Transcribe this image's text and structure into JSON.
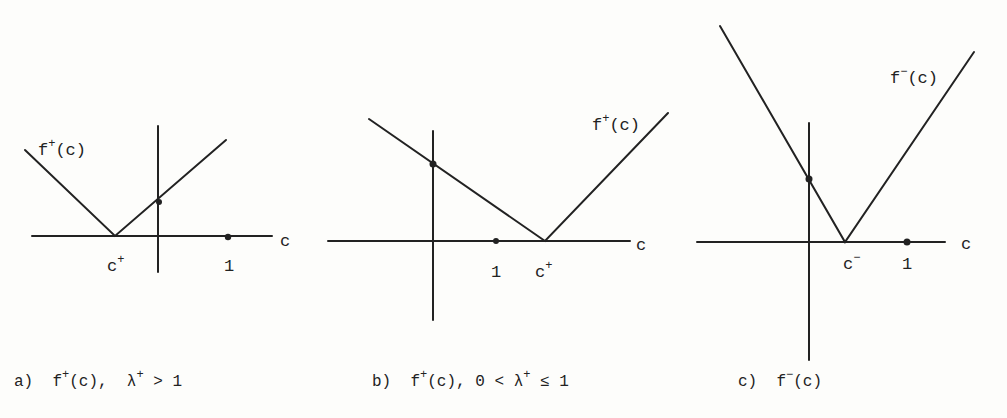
{
  "panels": [
    {
      "id": "a",
      "caption": {
        "prefix": "a)",
        "func": "f",
        "func_sup": "+",
        "func_arg": "(c),",
        "cond_symbol": "λ",
        "cond_sup": "+",
        "cond_rest": "> 1"
      },
      "curve_label": {
        "base": "f",
        "sup": "+",
        "arg": "(c)"
      },
      "axis_label": "c",
      "vertex_label": {
        "base": "c",
        "sup": "+"
      },
      "one_label": "1"
    },
    {
      "id": "b",
      "caption": {
        "prefix": "b)",
        "func": "f",
        "func_sup": "+",
        "func_arg": "(c), 0 <",
        "cond_symbol": "λ",
        "cond_sup": "+",
        "cond_rel": "≤",
        "cond_rest": "1"
      },
      "curve_label": {
        "base": "f",
        "sup": "+",
        "arg": "(c)"
      },
      "axis_label": "c",
      "vertex_label": {
        "base": "c",
        "sup": "+"
      },
      "one_label": "1"
    },
    {
      "id": "c",
      "caption": {
        "prefix": "c)",
        "func": "f",
        "func_sup": "−",
        "func_arg": "(c)"
      },
      "curve_label": {
        "base": "f",
        "sup": "−",
        "arg": "(c)"
      },
      "axis_label": "c",
      "vertex_label": {
        "base": "c",
        "sup": "−"
      },
      "one_label": "1"
    }
  ],
  "colors": {
    "ink": "#222222",
    "paper": "#fdfdfb"
  }
}
